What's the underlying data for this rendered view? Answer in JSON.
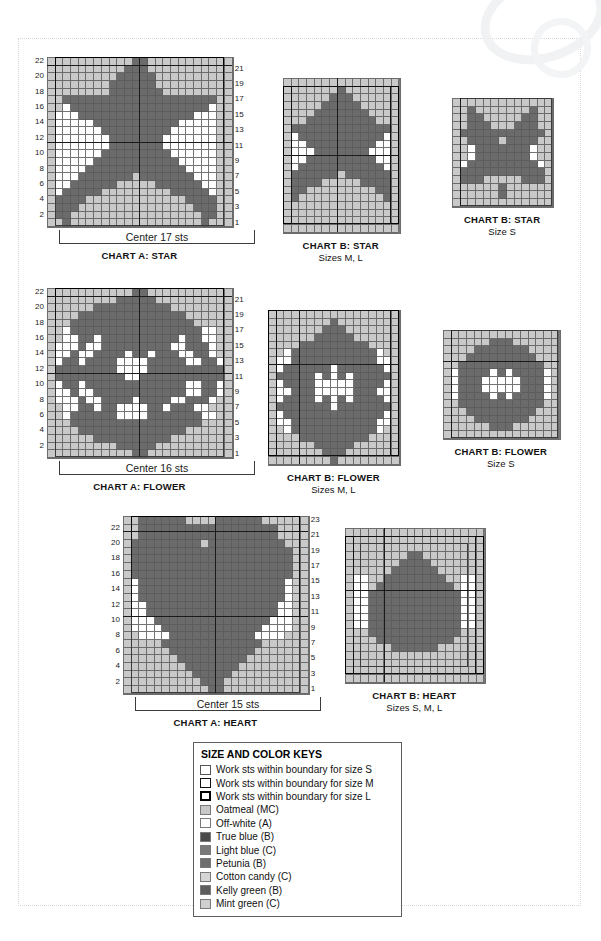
{
  "colors": {
    "mc_oatmeal": "#c9c9c9",
    "off_white": "#ffffff",
    "true_blue": "#4a4a4a",
    "light_blue": "#7a7a7a",
    "petunia": "#6e6e6e",
    "cotton_candy": "#d5d5d5",
    "kelly_green": "#5e5e5e",
    "mint_green": "#cfcfcf",
    "dark": "#6b6b6b",
    "grid_line": "#5a5a5a",
    "outline": "#1a1a1a"
  },
  "legend": {
    "title": "SIZE AND COLOR KEYS",
    "items": [
      {
        "label": "Work sts within boundary for size S",
        "swatch": "outline-thin",
        "color": "#ffffff"
      },
      {
        "label": "Work sts within boundary for size M",
        "swatch": "outline-med",
        "color": "#ffffff"
      },
      {
        "label": "Work sts within boundary for size L",
        "swatch": "outline-thick",
        "color": "#ffffff"
      },
      {
        "label": "Oatmeal (MC)",
        "swatch": "fill",
        "color": "#c9c9c9"
      },
      {
        "label": "Off-white (A)",
        "swatch": "fill",
        "color": "#ffffff"
      },
      {
        "label": "True blue (B)",
        "swatch": "fill",
        "color": "#4a4a4a"
      },
      {
        "label": "Light blue (C)",
        "swatch": "fill",
        "color": "#7a7a7a"
      },
      {
        "label": "Petunia (B)",
        "swatch": "fill",
        "color": "#6e6e6e"
      },
      {
        "label": "Cotton candy (C)",
        "swatch": "fill",
        "color": "#d5d5d5"
      },
      {
        "label": "Kelly green (B)",
        "swatch": "fill",
        "color": "#5e5e5e"
      },
      {
        "label": "Mint green (C)",
        "swatch": "fill",
        "color": "#cfcfcf"
      }
    ]
  },
  "charts": [
    {
      "id": "chart-a-star",
      "title": "CHART A: STAR",
      "subtitle": "",
      "center_label": "Center 17 sts",
      "cols": 24,
      "rows": 22,
      "cell": 7.7,
      "left_numbers": [
        22,
        20,
        18,
        16,
        14,
        12,
        10,
        8,
        6,
        4,
        2
      ],
      "right_numbers": [
        21,
        19,
        17,
        15,
        13,
        11,
        9,
        7,
        5,
        3,
        1
      ],
      "rows_data": [
        "MMMMMMMMMMMDDMMMMMMMMMMM",
        "MMMMMMMMMMDDDMMMMMMMMMMM",
        "MMMMMMMMMDDDDDMMMMMMMMMM",
        "MMMMMMMMDDDDDDMMMMMMMMMM",
        "MMMMMMMMDDDDDDDMMMMMMMMM",
        "MMDDDDDDDDDDDDDDDDDDDDMM",
        "MMWDDDDDDDDDDDDDDDDDDWMM",
        "MWWWDDDDDDDDDDDDDDDWWWMM",
        "MWWWWWDDDDDDDDDDDWWWWWMM",
        "MWWWWWWDDDDDDDDDWWWWWWMM",
        "MWWWWWWWDDDDDDDWWWWWWWMM",
        "MWWWWWWWDDDDDDDWWWWWWWMM",
        "MWWWWWWDDDDDDDDDWWWWWWMM",
        "MWWWWWDDDDDDDDDDDWWWWWMM",
        "MWWWWDDDDDDDDDDDDDWWWWMM",
        "MWWWDDDDDDDMDDDDDDDWWWMM",
        "MWWDDDDDDMMMMMDDDDDDWWMM",
        "MWDDDDDMMMMMMMMMDDDDDWMM",
        "MDDDDMMMMMMMMMMMMMDDDDMM",
        "MDDDMMMMMMMMMMMMMMMDDDMM",
        "MDDMMMMMMMMMMMMMMMMMDDMM",
        "MMDMMMMMMMMMMMMMMMMMDMMM"
      ],
      "boundaries": {
        "l": {
          "c0": 1,
          "c1": 23,
          "r0": 0,
          "r1": 22
        },
        "m": {
          "c0": 1,
          "c1": 23,
          "r0": 1,
          "r1": 22
        },
        "s": {
          "c0": 1,
          "c1": 23,
          "r0": 11,
          "r1": 22
        }
      },
      "vlines": [
        12
      ],
      "hlines": [
        1,
        11
      ]
    },
    {
      "id": "chart-b-star-ml",
      "title": "CHART B: STAR",
      "subtitle": "Sizes M, L",
      "center_label": "",
      "cols": 15,
      "rows": 20,
      "cell": 7.7,
      "left_numbers": [],
      "right_numbers": [],
      "rows_data": [
        "MMMMMMMMMMMMMMM",
        "MMMMMMMDMMMMMMM",
        "MMMMMMDDDMMMMMM",
        "MMMMMDDDDDMMMMM",
        "MMMMDDDDDDDMMMM",
        "MMMDDDDDDDDDMMM",
        "MDDDDDDDDDDDDDM",
        "MWDDDDDDDDDDDWM",
        "MWWDDDDDDDDDWWM",
        "MWWWDDDDDDDWWWM",
        "MWWDDDDDDDDDWWM",
        "MWDDDDDDDDDDDWM",
        "MDDDDDDMDDDDDDM",
        "MDDDDMMMMMDDDDM",
        "MDDMMMMMMMMMDDM",
        "MDMMMMMMMMMMMDM",
        "MMMMMMMMMMMMMMM",
        "MMMMMMMMMMMMMMM",
        "MMMMMMMMMMMMMMM",
        "MMMMMMMMMMMMMMM"
      ],
      "boundaries": {
        "l": {
          "c0": 0,
          "c1": 15,
          "r0": 1,
          "r1": 19
        },
        "m": {
          "c0": 1,
          "c1": 14,
          "r0": 1,
          "r1": 19
        },
        "s": null
      },
      "vlines": [
        7
      ],
      "hlines": [
        10
      ]
    },
    {
      "id": "chart-b-star-s",
      "title": "CHART B: STAR",
      "subtitle": "Size S",
      "center_label": "",
      "cols": 13,
      "rows": 14,
      "cell": 7.7,
      "left_numbers": [],
      "right_numbers": [],
      "rows_data": [
        "MMMMMMMMMMMMM",
        "MMDMMMMMMMDMM",
        "MMDDMMMMMDDMM",
        "MMDDDMMMDDDMM",
        "MDDDDDDDDDDDM",
        "MMDDDDMDDDDMM",
        "MMWDDDDDDDWMM",
        "MMWDDDDDDDWMM",
        "MWDDDDDDDDDWM",
        "MDDDDDDDDDDDM",
        "MDDDMMMMMDDDM",
        "MMMMMMDMMMMMM",
        "MMMMMMDMMMMMM",
        "MMMMMMMMMMMMM"
      ],
      "boundaries": {
        "l": null,
        "m": null,
        "s": {
          "c0": 1,
          "c1": 13,
          "r0": 0,
          "r1": 14
        }
      },
      "vlines": [
        1
      ],
      "hlines": []
    },
    {
      "id": "chart-a-flower",
      "title": "CHART A: FLOWER",
      "subtitle": "",
      "center_label": "Center 16 sts",
      "cols": 24,
      "rows": 22,
      "cell": 7.7,
      "left_numbers": [
        22,
        20,
        18,
        16,
        14,
        12,
        10,
        8,
        6,
        4,
        2
      ],
      "right_numbers": [
        21,
        19,
        17,
        15,
        13,
        11,
        9,
        7,
        5,
        3,
        1
      ],
      "rows_data": [
        "MMMMMMMMMMMDDMMMMMMMMMMM",
        "MMMMMMMMMDDDDDMMMMMMMMMM",
        "MMMMMMDDDDDDDDDDMMMMMMMM",
        "MMMMDDDDDDDDDDDDDDMMMMMM",
        "MMMDDDDDDDDDDDDDDDDMMMMM",
        "MMWDDDDDDDDDDDDDDDDDWWMM",
        "MMWWDDWDDDDDDDDDDWDDWWMM",
        "MWWWDWWDDDDDDDDDWWDDDWMM",
        "MWWDWWDDDDWDDWDDDWWDDWMM",
        "MWDDWDDDDWWWWDDDDDWWDDWM",
        "MDDDDDDDDWWWWDDDDDDDDDDM",
        "MDDDDDDDDDWWDDDDDDDDDDDM",
        "MWDDWDDDDDDDDDDDDDWWDDWM",
        "MWWDWWDDDDDDDDDDDDWWDDWM",
        "MWWWDWWDDDDWDDDDWWDDDWMM",
        "MMWWDDWDDWWWWDDWDDDWWMMM",
        "MMWDDDDDDWWWWDDDDDDDWWMM",
        "MMMDDDDDDDDDDDDDDDDDMMMM",
        "MMMMDDDDDDDDDDDDDDMMMMMM",
        "MMMMMMDDDDDDDDDDMMMMMMMM",
        "MMMMMMMMMDDDDDMMMMMMMMMM",
        "MMMMMMMMMMMDDMMMMMMMMMMM"
      ],
      "boundaries": {
        "l": {
          "c0": 1,
          "c1": 23,
          "r0": 0,
          "r1": 22
        },
        "m": {
          "c0": 1,
          "c1": 23,
          "r0": 1,
          "r1": 22
        },
        "s": {
          "c0": 1,
          "c1": 23,
          "r0": 11,
          "r1": 22
        }
      },
      "vlines": [
        12
      ],
      "hlines": [
        1,
        11
      ]
    },
    {
      "id": "chart-b-flower-ml",
      "title": "CHART B: FLOWER",
      "subtitle": "Sizes M, L",
      "center_label": "",
      "cols": 17,
      "rows": 20,
      "cell": 7.7,
      "left_numbers": [],
      "right_numbers": [],
      "rows_data": [
        "MMMMMMMMMMMMMMMMM",
        "MMMMMMMMDMMMMMMMM",
        "MMMMMMMDDDMMMMMMM",
        "MMMMMMDDDDDMMMMMM",
        "MMMMDDDDDDDDDMMMM",
        "MMWDDDDDDDDDDDWMM",
        "MWWDDDDDDDDDDDWWM",
        "MWDDDDDDWDDDDDDWM",
        "MDDDDDWDWDWDDDDDM",
        "MWDDDDWWWWWDDDDWM",
        "MWWDDDWWWWWDDDWWM",
        "MWDDDDWDWDWDDDDWM",
        "MDDDDDDDWDDDDDDDM",
        "MWDDDDDDDDDDDDDWM",
        "MWWDDDDDDDDDDDWWM",
        "MMWDDDDDDDDDDDWMM",
        "MMMMDDDDDDDDDMMMM",
        "MMMMMMDDDDDMMMMMM",
        "MMMMMMMDDDMMMMMMM",
        "MMMMMMMMDMMMMMMMM"
      ],
      "boundaries": {
        "l": {
          "c0": 0,
          "c1": 17,
          "r0": 0,
          "r1": 19
        },
        "m": {
          "c0": 1,
          "c1": 16,
          "r0": 0,
          "r1": 19
        },
        "s": null
      },
      "vlines": [
        4
      ],
      "hlines": [
        7
      ]
    },
    {
      "id": "chart-b-flower-s",
      "title": "CHART B: FLOWER",
      "subtitle": "Size S",
      "center_label": "",
      "cols": 15,
      "rows": 14,
      "cell": 7.7,
      "left_numbers": [],
      "right_numbers": [],
      "rows_data": [
        "MMMMMMMMMMMMMMM",
        "MMMMMMDDDMMMMMM",
        "MMMMDDDDDDDMMMM",
        "MMMDDDDDDDDDMMM",
        "MMDDDDDDDDDDDMM",
        "MWDDDDWDWDDDDWM",
        "MWDDDWWWWWDDDWM",
        "MWDDDWWWWWDDDWM",
        "MWDDDDWDWDDDDWM",
        "MMDDDDDDDDDDDMM",
        "MMMDDDDDDDDDMMM",
        "MMMMDDDDDDDMMMM",
        "MMMMMMDDDMMMMMM",
        "MMMMMMMMMMMMMMM"
      ],
      "boundaries": {
        "l": null,
        "m": null,
        "s": {
          "c0": 1,
          "c1": 15,
          "r0": 0,
          "r1": 14
        }
      },
      "vlines": [
        1
      ],
      "hlines": [
        4
      ]
    },
    {
      "id": "chart-a-heart",
      "title": "CHART A: HEART",
      "subtitle": "",
      "center_label": "Center 15 sts",
      "cols": 24,
      "rows": 23,
      "cell": 7.7,
      "left_numbers": [
        22,
        20,
        18,
        16,
        14,
        12,
        10,
        8,
        6,
        4,
        2
      ],
      "right_numbers": [
        23,
        21,
        19,
        17,
        15,
        13,
        11,
        9,
        7,
        5,
        3,
        1
      ],
      "rows_data": [
        "MMDDDDDDMMMMDDDDDDMMMMMM",
        "MMDDDDDDDDDDDDDDDDDDMMMM",
        "MMDDDDDDDDDDDDDDDDDDMMMM",
        "MDDDDDDDDDMDDDDDDDDDDMMM",
        "MDDDDDDDDDDDDDDDDDDDDDMM",
        "MDDDDDDDDDDDDDDDDDDDDDMM",
        "MDDDDDDDDDDDDDDDDDDDDDMM",
        "MDDDDDDDDDDDDDDDDDDDDDMM",
        "MWDDDDDDDDDDDDDDDDDDDWMM",
        "MWDDDDDDDDDDDDDDDDDDDWMM",
        "MWDDDDDDDDDDDDDDDDDDDWMM",
        "MWWDDDDDDDDDDDDDDDDDWWMM",
        "MWWDDDDDDDDDDDDDDDDDWWMM",
        "MWWWDDDDDDDDDDDDDDDWWWMM",
        "MWWWWDDDDDDDDDDDDDWWWWMM",
        "MMWWWWDDDDDDDDDDDWWWWMMM",
        "MMMMMDDDDDDDDDDDDDMMMMMM",
        "MMMMMMDDDDDDDDDDDMMMMMMM",
        "MMMMMMMDDDDDDDDDMMMMMMMM",
        "MMMMMMMMDDDDDDDMMMMMMMMM",
        "MMMMMMMMMDDDDDMMMMMMMMMM",
        "MMMMMMMMMMDDDMMMMMMMMMMM",
        "MMMMMMMMMMMDDMMMMMMMMMMM"
      ],
      "boundaries": {
        "l": {
          "c0": 1,
          "c1": 23,
          "r0": 0,
          "r1": 23
        },
        "m": {
          "c0": 1,
          "c1": 23,
          "r0": 2,
          "r1": 23
        },
        "s": {
          "c0": 1,
          "c1": 23,
          "r0": 13,
          "r1": 23
        }
      },
      "vlines": [
        12
      ],
      "hlines": [
        2,
        13
      ]
    },
    {
      "id": "chart-b-heart",
      "title": "CHART B: HEART",
      "subtitle": "Sizes S, M, L",
      "center_label": "",
      "cols": 18,
      "rows": 20,
      "cell": 7.7,
      "left_numbers": [],
      "right_numbers": [],
      "rows_data": [
        "MMMMMMMMMMMMMMMMMM",
        "MMMMMMMMMMMMMMMMMM",
        "MMMMMMMMMMMMMMMMMM",
        "MMMMMMMMDDMMMMMMMM",
        "MMMMMMMDDDDMMMMMMM",
        "MMMMMMDDDDDDMMMMMM",
        "MWWMMDDDDDDDDMMWWM",
        "MWWMDDDDDDDDDDMWWM",
        "MWWDDDDDDDDDDDDWWM",
        "MWWDDDDDDDDDDDDWWM",
        "MWWDDDDDDDDDDDDWWM",
        "MWWDDDDDDDDDDDDWWM",
        "MWWDDDDDDDDDDDDWWM",
        "MMMDDDDDDDDDDDDMMM",
        "MMMMDDDDDDDDDDMMMM",
        "MMMMMMDDDDDDMMMMMM",
        "MMMMMMMMMMMMMMMMMM",
        "MMMMMMMMMMMMMMMMMM",
        "MMMMMMMMMMMMMMMMMM",
        "MMMMMMMMMMMMMMMMMM"
      ],
      "boundaries": {
        "l": {
          "c0": 0,
          "c1": 18,
          "r0": 1,
          "r1": 19
        },
        "m": {
          "c0": 1,
          "c1": 17,
          "r0": 1,
          "r1": 19
        },
        "s": {
          "c0": 2,
          "c1": 16,
          "r0": 2,
          "r1": 18
        }
      },
      "vlines": [
        5
      ],
      "hlines": [
        8
      ]
    }
  ]
}
